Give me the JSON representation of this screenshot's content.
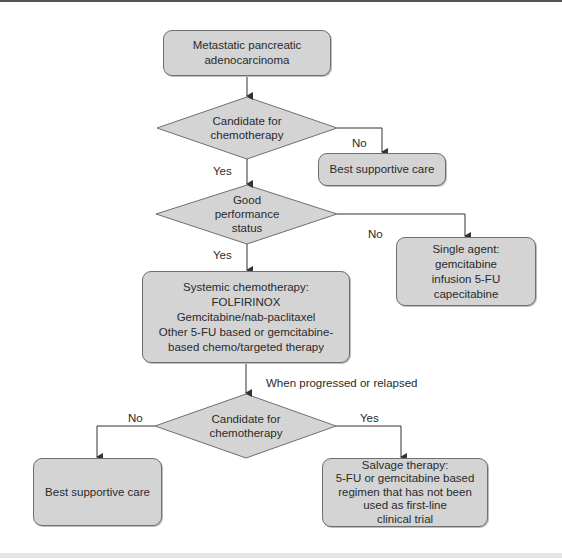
{
  "flowchart": {
    "start": {
      "label": "Metastatic pancreatic\nadenocarcinoma"
    },
    "decision_candidate_1": {
      "label": "Candidate for\nchemotherapy"
    },
    "bsc_1": {
      "label": "Best supportive care"
    },
    "decision_performance": {
      "label": "Good\nperformance\nstatus"
    },
    "single_agent": {
      "label": "Single agent:\ngemcitabine\ninfusion 5-FU\ncapecitabine"
    },
    "systemic": {
      "label": "Systemic chemotherapy:\nFOLFIRINOX\nGemcitabine/nab-paclitaxel\nOther 5-FU based or gemcitabine-\nbased chemo/targeted therapy"
    },
    "decision_candidate_2": {
      "label": "Candidate for\nchemotherapy"
    },
    "bsc_2": {
      "label": "Best supportive care"
    },
    "salvage": {
      "label": "Salvage therapy:\n5-FU or gemcitabine based\nregimen that has not been\nused as first-line\nclinical trial"
    },
    "edges": {
      "no_1": "No",
      "yes_1": "Yes",
      "no_2": "No",
      "yes_2": "Yes",
      "progressed": "When progressed or relapsed",
      "no_3": "No",
      "yes_3": "Yes"
    }
  },
  "colors": {
    "node_fill": "#d4d4d4",
    "node_border": "#6f6f6f",
    "line": "#333333",
    "text": "#2a2a2a"
  }
}
